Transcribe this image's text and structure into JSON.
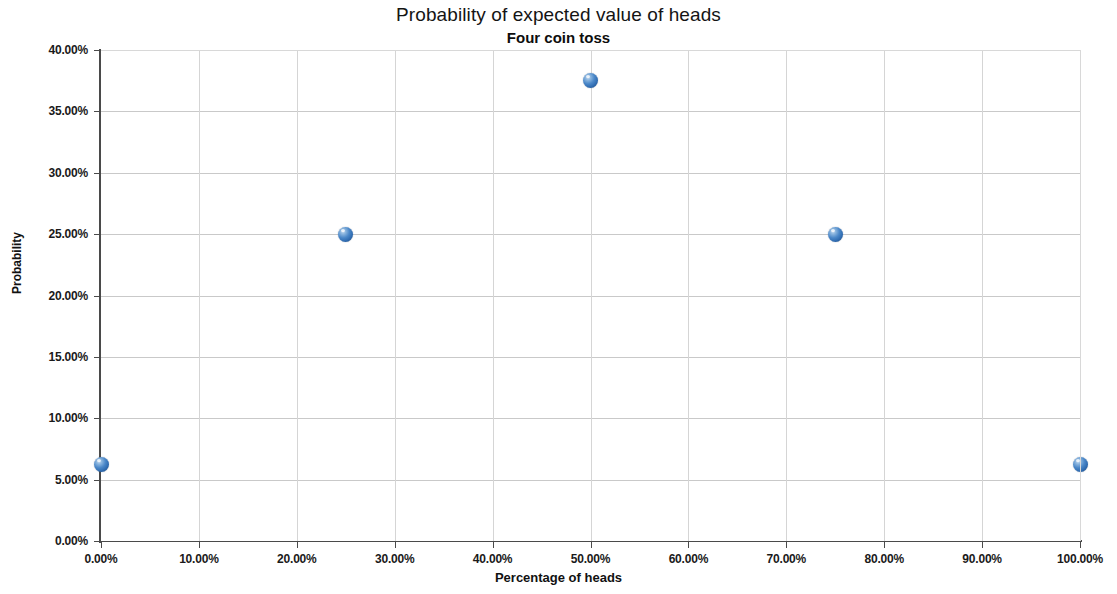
{
  "chart_data": {
    "type": "scatter",
    "title": "Probability of expected value of heads",
    "subtitle": "Four coin toss",
    "xlabel": "Percentage of heads",
    "ylabel": "Probability",
    "xlim": [
      0,
      100
    ],
    "ylim": [
      0,
      40
    ],
    "grid": true,
    "legend": "none",
    "x_tick_labels": [
      "0.00%",
      "10.00%",
      "20.00%",
      "30.00%",
      "40.00%",
      "50.00%",
      "60.00%",
      "70.00%",
      "80.00%",
      "90.00%",
      "100.00%"
    ],
    "x_tick_values": [
      0,
      10,
      20,
      30,
      40,
      50,
      60,
      70,
      80,
      90,
      100
    ],
    "y_tick_labels": [
      "0.00%",
      "5.00%",
      "10.00%",
      "15.00%",
      "20.00%",
      "25.00%",
      "30.00%",
      "35.00%",
      "40.00%"
    ],
    "y_tick_values": [
      0,
      5,
      10,
      15,
      20,
      25,
      30,
      35,
      40
    ],
    "series": [
      {
        "name": "Probability",
        "marker_color": "#2f6bb0",
        "points": [
          {
            "x": 0,
            "y": 6.25,
            "label": "0.00%, 6.25%"
          },
          {
            "x": 25,
            "y": 25.0,
            "label": "25.00%, 25.00%"
          },
          {
            "x": 50,
            "y": 37.5,
            "label": "50.00%, 37.50%"
          },
          {
            "x": 75,
            "y": 25.0,
            "label": "75.00%, 25.00%"
          },
          {
            "x": 100,
            "y": 6.25,
            "label": "100.00%, 6.25%"
          }
        ]
      }
    ]
  }
}
